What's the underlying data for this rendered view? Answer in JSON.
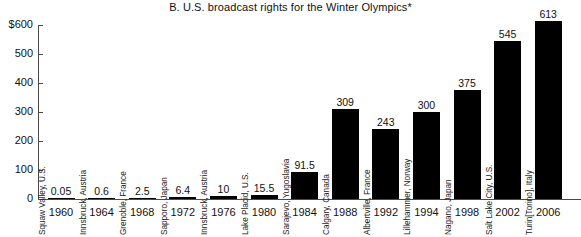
{
  "chart_data": {
    "type": "bar",
    "title": "B.  U.S. broadcast rights for the Winter Olympics*",
    "xlabel": "",
    "ylabel": "",
    "ylim": [
      0,
      600
    ],
    "ytick_labels": [
      "$600",
      "500",
      "400",
      "300",
      "200",
      "100",
      "0"
    ],
    "ytick_values": [
      600,
      500,
      400,
      300,
      200,
      100,
      0
    ],
    "grid": false,
    "legend": "none",
    "categories": [
      "1960",
      "1964",
      "1968",
      "1972",
      "1976",
      "1980",
      "1984",
      "1988",
      "1992",
      "1994",
      "1998",
      "2002",
      "2006"
    ],
    "values": [
      0.05,
      0.6,
      2.5,
      6.4,
      10,
      15.5,
      91.5,
      309,
      243,
      300,
      375,
      545,
      613
    ],
    "value_labels": [
      "0.05",
      "0.6",
      "2.5",
      "6.4",
      "10",
      "15.5",
      "91.5",
      "309",
      "243",
      "300",
      "375",
      "545",
      "613"
    ],
    "point_labels": [
      "Squaw Valley, U.S.",
      "Innsbruck, Austria",
      "Grenoble, France",
      "Sapporo, Japan",
      "Innsbruck, Austria",
      "Lake Placid, U.S.",
      "Sarajevo, Yugoslavia",
      "Calgary, Canada",
      "Albertville, France",
      "Lillehammer, Norway",
      "Nagano, Japan",
      "Salt Lake City, U.S.",
      "Turin[Torino], Italy"
    ],
    "bar_color": "#000000",
    "axis_color": "#4a4a4a",
    "background": "#ffffff"
  },
  "bars": [
    {
      "year": "1960",
      "city": "Squaw Valley, U.S.",
      "value_label": "0.05",
      "value": 0.05
    },
    {
      "year": "1964",
      "city": "Innsbruck, Austria",
      "value_label": "0.6",
      "value": 0.6
    },
    {
      "year": "1968",
      "city": "Grenoble, France",
      "value_label": "2.5",
      "value": 2.5
    },
    {
      "year": "1972",
      "city": "Sapporo, Japan",
      "value_label": "6.4",
      "value": 6.4
    },
    {
      "year": "1976",
      "city": "Innsbruck, Austria",
      "value_label": "10",
      "value": 10
    },
    {
      "year": "1980",
      "city": "Lake Placid, U.S.",
      "value_label": "15.5",
      "value": 15.5
    },
    {
      "year": "1984",
      "city": "Sarajevo, Yugoslavia",
      "value_label": "91.5",
      "value": 91.5
    },
    {
      "year": "1988",
      "city": "Calgary, Canada",
      "value_label": "309",
      "value": 309
    },
    {
      "year": "1992",
      "city": "Albertville, France",
      "value_label": "243",
      "value": 243
    },
    {
      "year": "1994",
      "city": "Lillehammer, Norway",
      "value_label": "300",
      "value": 300
    },
    {
      "year": "1998",
      "city": "Nagano, Japan",
      "value_label": "375",
      "value": 375
    },
    {
      "year": "2002",
      "city": "Salt Lake City, U.S.",
      "value_label": "545",
      "value": 545
    },
    {
      "year": "2006",
      "city": "Turin[Torino], Italy",
      "value_label": "613",
      "value": 613
    }
  ],
  "y_axis": {
    "ticks": [
      {
        "label": "$600",
        "value": 600
      },
      {
        "label": "500",
        "value": 500
      },
      {
        "label": "400",
        "value": 400
      },
      {
        "label": "300",
        "value": 300
      },
      {
        "label": "200",
        "value": 200
      },
      {
        "label": "100",
        "value": 100
      },
      {
        "label": "0",
        "value": 0
      }
    ]
  }
}
